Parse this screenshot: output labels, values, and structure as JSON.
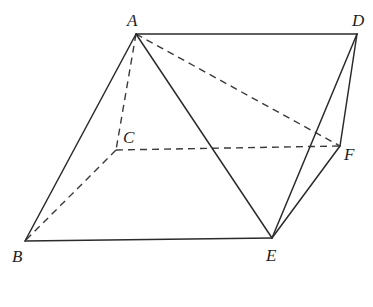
{
  "figure": {
    "type": "solid-geometry",
    "vertices": {
      "A": {
        "label": "A",
        "x": 136,
        "y": 34,
        "lx": 127,
        "ly": 26
      },
      "D": {
        "label": "D",
        "x": 357,
        "y": 34,
        "lx": 352,
        "ly": 26
      },
      "C": {
        "label": "C",
        "x": 116,
        "y": 150,
        "lx": 123,
        "ly": 143
      },
      "F": {
        "label": "F",
        "x": 340,
        "y": 146,
        "lx": 344,
        "ly": 160
      },
      "B": {
        "label": "B",
        "x": 25,
        "y": 241,
        "lx": 12,
        "ly": 262
      },
      "E": {
        "label": "E",
        "x": 272,
        "y": 238,
        "lx": 266,
        "ly": 261
      }
    },
    "solid_edges": [
      [
        "A",
        "D"
      ],
      [
        "A",
        "B"
      ],
      [
        "A",
        "E"
      ],
      [
        "B",
        "E"
      ],
      [
        "D",
        "E"
      ],
      [
        "D",
        "F"
      ],
      [
        "F",
        "E"
      ]
    ],
    "dashed_edges": [
      [
        "A",
        "C"
      ],
      [
        "A",
        "F"
      ],
      [
        "C",
        "B"
      ],
      [
        "C",
        "F"
      ]
    ],
    "labels": [
      "A",
      "B",
      "C",
      "D",
      "E",
      "F"
    ]
  }
}
